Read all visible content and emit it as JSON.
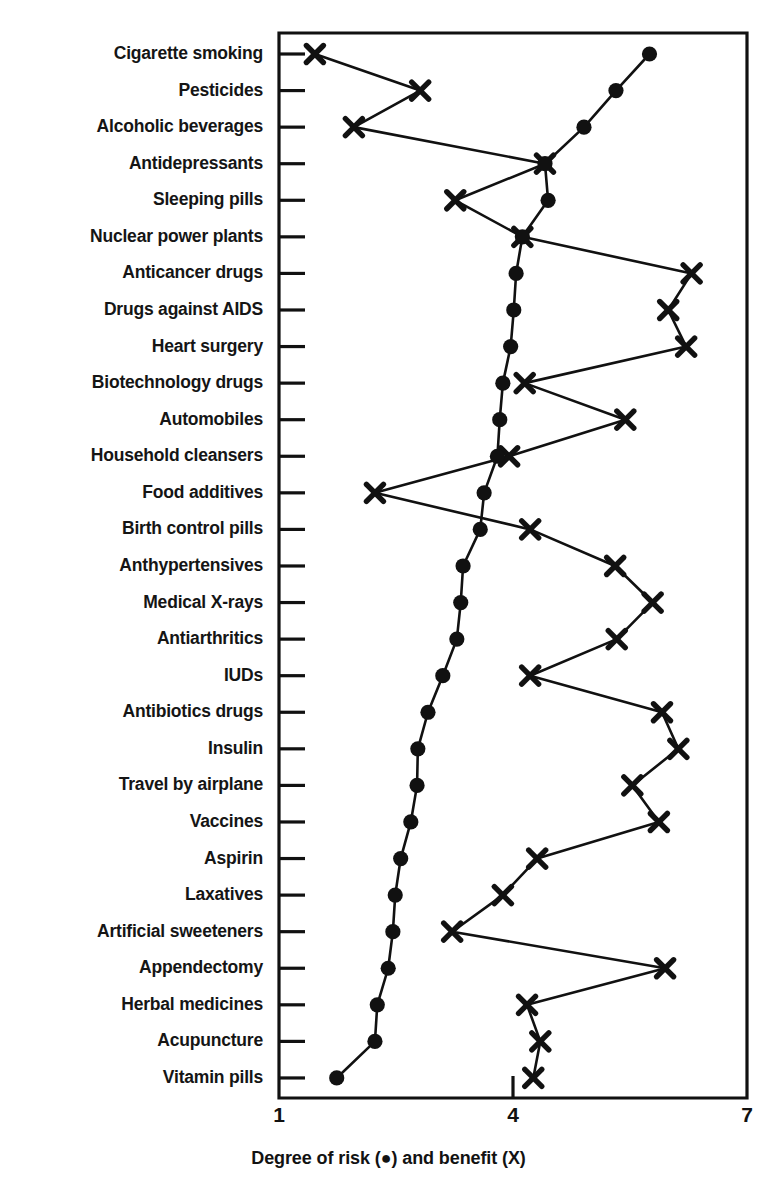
{
  "figure": {
    "axis_title": "Degree of risk (●) and benefit (X)",
    "x_ticks": [
      "1",
      "4",
      "7"
    ]
  },
  "chart_data": {
    "type": "line",
    "title": "",
    "xlabel": "Degree of risk (●) and benefit (X)",
    "ylabel": "",
    "xlim": [
      1,
      7
    ],
    "xticks": [
      1,
      4,
      7
    ],
    "grid": false,
    "legend": "inline in axis label: ● = risk, X = benefit",
    "orientation": "horizontal",
    "categories": [
      "Cigarette smoking",
      "Pesticides",
      "Alcoholic beverages",
      "Antidepressants",
      "Sleeping pills",
      "Nuclear power plants",
      "Anticancer drugs",
      "Drugs against AIDS",
      "Heart surgery",
      "Biotechnology drugs",
      "Automobiles",
      "Household cleansers",
      "Food additives",
      "Birth control pills",
      "Anthypertensives",
      "Medical X-rays",
      "Antiarthritics",
      "IUDs",
      "Antibiotics drugs",
      "Insulin",
      "Travel by airplane",
      "Vaccines",
      "Aspirin",
      "Laxatives",
      "Artificial sweeteners",
      "Appendectomy",
      "Herbal medicines",
      "Acupuncture",
      "Vitamin pills"
    ],
    "series": [
      {
        "name": "Degree of risk",
        "marker": "filled-circle",
        "values": [
          5.75,
          5.32,
          4.91,
          4.41,
          4.45,
          4.12,
          4.04,
          4.01,
          3.97,
          3.87,
          3.83,
          3.8,
          3.63,
          3.58,
          3.36,
          3.33,
          3.28,
          3.1,
          2.91,
          2.78,
          2.77,
          2.69,
          2.56,
          2.49,
          2.46,
          2.4,
          2.26,
          2.23,
          1.74
        ]
      },
      {
        "name": "Degree of benefit",
        "marker": "x-cross",
        "values": [
          1.46,
          2.81,
          1.96,
          4.41,
          3.26,
          4.12,
          6.29,
          5.99,
          6.22,
          4.15,
          5.44,
          3.95,
          2.23,
          4.22,
          5.31,
          5.79,
          5.33,
          4.22,
          5.91,
          6.12,
          5.53,
          5.87,
          4.31,
          3.87,
          3.22,
          5.95,
          4.18,
          4.35,
          4.26
        ]
      }
    ]
  }
}
